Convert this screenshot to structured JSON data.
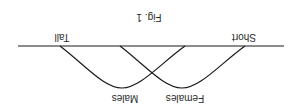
{
  "figure": {
    "title": "Fig. 1",
    "orientation": "rotated 180 degrees",
    "axis": {
      "left_label": "Short",
      "right_label": "Tall"
    },
    "curves": [
      {
        "name": "Females",
        "label": "Females"
      },
      {
        "name": "Males",
        "label": "Males"
      }
    ],
    "colors": {
      "line": "#1a1a1a",
      "background": "#ffffff",
      "text": "#2b2b2b"
    }
  }
}
